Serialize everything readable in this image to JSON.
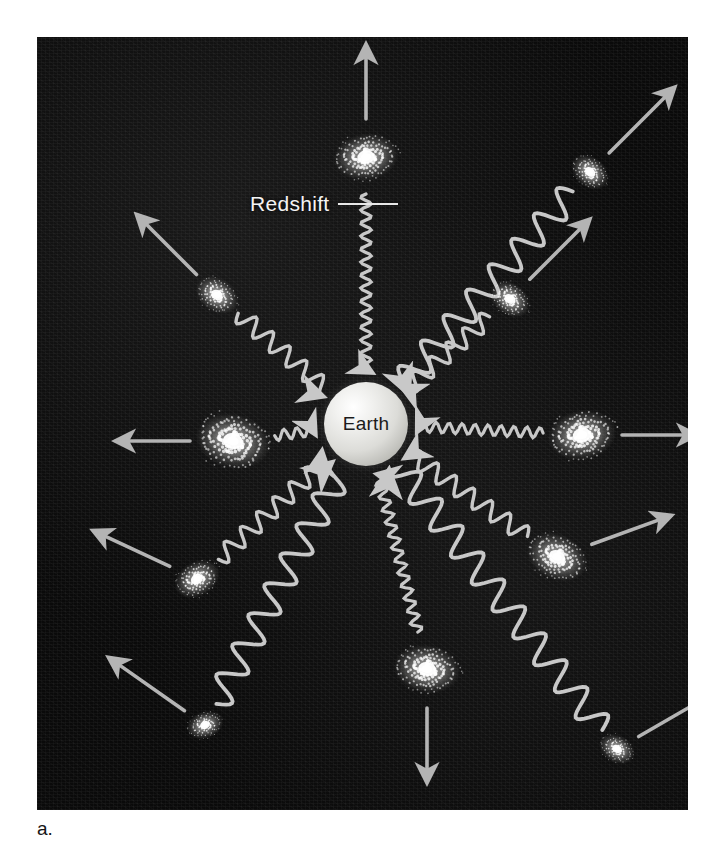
{
  "figure": {
    "caption": "a.",
    "panel": {
      "background_color": "#0a0a0a",
      "width": 651,
      "height": 773
    }
  },
  "center": {
    "label": "Earth",
    "name": "earth-sphere",
    "cx": 329,
    "cy": 387,
    "r": 42,
    "fill_color": "#e8e8e4",
    "text_color": "#1b1b1b"
  },
  "annotation": {
    "label": "Redshift",
    "leader_line": true,
    "text_color": "#f4f4f4"
  },
  "colors": {
    "wave": "#c8c8c8",
    "arrow": "#b4b4b4",
    "galaxy_core": "#ffffff",
    "galaxy_arm": "#d8d8d8",
    "sky": "#0a0a0a"
  },
  "chart_data": {
    "type": "scatter",
    "xlabel": "",
    "ylabel": "",
    "center_object": "Earth",
    "wavelength_legend": [
      {
        "tier": "near",
        "wavelength_px": 13,
        "meaning": "small redshift"
      },
      {
        "tier": "mid",
        "wavelength_px": 22,
        "meaning": "moderate redshift"
      },
      {
        "tier": "far",
        "wavelength_px": 34,
        "meaning": "large redshift"
      }
    ],
    "galaxies": [
      {
        "id": "g-top",
        "x": 329,
        "y": 120,
        "distance_tier": "near",
        "angle_deg": 270,
        "size": 62,
        "tilt_deg": -8,
        "recession_arrow": true,
        "wave": true,
        "wavelength_px": 13
      },
      {
        "id": "g-top-far",
        "x": 553,
        "y": 135,
        "distance_tier": "far",
        "angle_deg": 315,
        "size": 40,
        "tilt_deg": 40,
        "recession_arrow": true,
        "wave": true,
        "wavelength_px": 34
      },
      {
        "id": "g-upper-left",
        "x": 180,
        "y": 258,
        "distance_tier": "mid",
        "angle_deg": 225,
        "size": 44,
        "tilt_deg": 35,
        "recession_arrow": true,
        "wave": true,
        "wavelength_px": 22
      },
      {
        "id": "g-upper-right",
        "x": 473,
        "y": 262,
        "distance_tier": "mid",
        "angle_deg": 315,
        "size": 42,
        "tilt_deg": 38,
        "recession_arrow": true,
        "wave": true,
        "wavelength_px": 22
      },
      {
        "id": "g-left",
        "x": 196,
        "y": 404,
        "distance_tier": "near",
        "angle_deg": 180,
        "size": 72,
        "tilt_deg": 14,
        "recession_arrow": true,
        "wave": true,
        "wavelength_px": 13
      },
      {
        "id": "g-right",
        "x": 545,
        "y": 398,
        "distance_tier": "near",
        "angle_deg": 0,
        "size": 66,
        "tilt_deg": -10,
        "recession_arrow": true,
        "wave": true,
        "wavelength_px": 13
      },
      {
        "id": "g-lower-left",
        "x": 160,
        "y": 542,
        "distance_tier": "mid",
        "angle_deg": 205,
        "size": 46,
        "tilt_deg": -30,
        "recession_arrow": true,
        "wave": true,
        "wavelength_px": 22
      },
      {
        "id": "g-lower-right",
        "x": 520,
        "y": 520,
        "distance_tier": "mid",
        "angle_deg": 340,
        "size": 60,
        "tilt_deg": 25,
        "recession_arrow": true,
        "wave": true,
        "wavelength_px": 22
      },
      {
        "id": "g-bottom",
        "x": 390,
        "y": 632,
        "distance_tier": "near",
        "angle_deg": 90,
        "size": 64,
        "tilt_deg": 8,
        "recession_arrow": true,
        "wave": true,
        "wavelength_px": 13
      },
      {
        "id": "g-bottom-left",
        "x": 168,
        "y": 688,
        "distance_tier": "far",
        "angle_deg": 215,
        "size": 36,
        "tilt_deg": -20,
        "recession_arrow": true,
        "wave": true,
        "wavelength_px": 34
      },
      {
        "id": "g-bottom-right",
        "x": 580,
        "y": 712,
        "distance_tier": "far",
        "angle_deg": 330,
        "size": 36,
        "tilt_deg": 30,
        "recession_arrow": true,
        "wave": true,
        "wavelength_px": 34
      }
    ]
  }
}
